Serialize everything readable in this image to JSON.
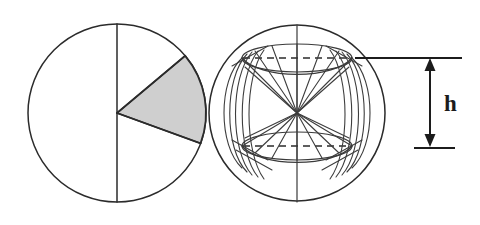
{
  "figure": {
    "background_color": "#ffffff",
    "line_color": "#2b2b2b",
    "shaded_color": "#cfcfcf",
    "labels": {
      "height_label": "h"
    },
    "left_diagram": {
      "name": "circle-with-shaded-sector",
      "circle": {
        "cx": 117,
        "cy": 113,
        "r": 89
      },
      "diameter_line": {
        "x": 117,
        "y1": 24,
        "y2": 202
      },
      "sector": {
        "apex": {
          "x": 117,
          "y": 113
        },
        "start_angle_deg": -40,
        "end_angle_deg": 20,
        "fill": "#cfcfcf"
      }
    },
    "right_diagram": {
      "name": "sphere-with-zone-and-cones",
      "circle": {
        "cx": 297,
        "cy": 113,
        "r": 88
      },
      "vertical_axis": {
        "x": 297,
        "y1": 25,
        "y2": 202
      },
      "top_plane_y": 58,
      "bottom_plane_y": 146,
      "top_ellipse": {
        "cx": 297,
        "cy": 58,
        "rx": 55,
        "ry": 13
      },
      "bottom_ellipse": {
        "cx": 297,
        "cy": 146,
        "rx": 55,
        "ry": 13
      },
      "center_point": {
        "x": 297,
        "y": 113
      },
      "radiating_line_count": 14,
      "arc_family_count": 5
    },
    "dimension": {
      "name": "height-dimension-h",
      "arrow_x": 430,
      "top_y": 58,
      "bottom_y": 147,
      "top_extension": {
        "x1": 355,
        "x2": 462,
        "y": 58
      },
      "bottom_extension": {
        "x1": 414,
        "x2": 455,
        "y": 148
      },
      "label": "h",
      "label_pos": {
        "x": 449,
        "y": 111
      }
    }
  }
}
